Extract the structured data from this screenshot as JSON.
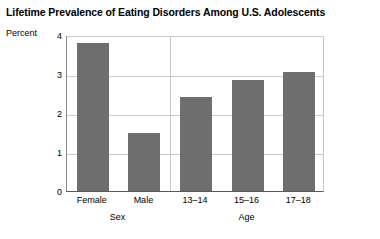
{
  "chart_data": {
    "type": "bar",
    "title": "Lifetime Prevalence of Eating Disorders Among U.S. Adolescents",
    "xlabel": "",
    "ylabel": "Percent",
    "ylim": [
      0,
      4
    ],
    "yticks": [
      "0",
      "1",
      "2",
      "3",
      "4"
    ],
    "grid": true,
    "legend": "none",
    "categories": [
      "Female",
      "Male",
      "13–14",
      "15–16",
      "17–18"
    ],
    "values": [
      3.8,
      1.5,
      2.4,
      2.85,
      3.05
    ],
    "groups": [
      {
        "label": "Sex",
        "categories": [
          "Female",
          "Male"
        ]
      },
      {
        "label": "Age",
        "categories": [
          "13–14",
          "15–16",
          "17–18"
        ]
      }
    ],
    "bar_color": "#6e6e6e",
    "gridline_color": "#c9c9c9",
    "axis_color": "#5a5a5a",
    "background": "#ffffff"
  }
}
